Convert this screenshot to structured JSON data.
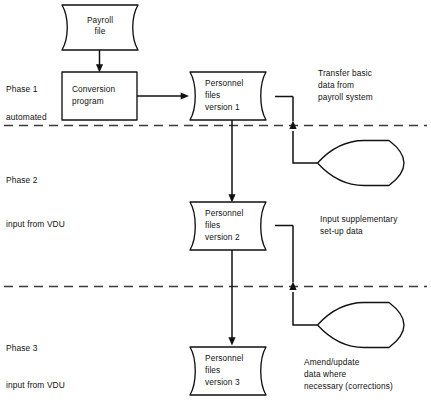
{
  "diagram": {
    "background_color": "#ffffff",
    "line_color": "#111111",
    "divider_color": "#3a3a3a"
  },
  "nodes": {
    "payroll_file": {
      "shape": "stored-data",
      "lines": [
        "Payroll",
        "file"
      ]
    },
    "conversion_program": {
      "shape": "process-rectangle",
      "lines": [
        "Conversion",
        "program"
      ]
    },
    "personnel_files_v1": {
      "shape": "stored-data",
      "lines": [
        "Personnel",
        "files",
        "version 1"
      ]
    },
    "personnel_files_v2": {
      "shape": "stored-data",
      "lines": [
        "Personnel",
        "files",
        "version 2"
      ]
    },
    "personnel_files_v3": {
      "shape": "stored-data",
      "lines": [
        "Personnel",
        "files",
        "version 3"
      ]
    },
    "display_1": {
      "shape": "display"
    },
    "display_2": {
      "shape": "display"
    }
  },
  "phases": [
    {
      "name": "Phase 1",
      "mode": "automated"
    },
    {
      "name": "Phase 2",
      "mode": "input from VDU"
    },
    {
      "name": "Phase 3",
      "mode": "input from VDU"
    }
  ],
  "notes": {
    "transfer": [
      "Transfer basic",
      "data from",
      "payroll system"
    ],
    "supplementary": [
      "Input supplementary",
      "set-up data"
    ],
    "amend": [
      "Amend/update",
      "data where",
      "necessary (corrections)"
    ]
  }
}
